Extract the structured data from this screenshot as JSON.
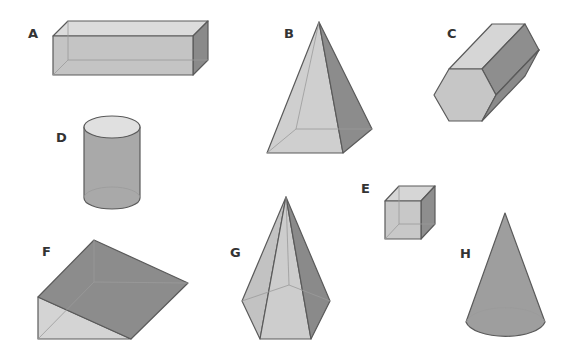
{
  "figure": {
    "background": "#ffffff",
    "shapes": [
      {
        "id": "A",
        "label": "A",
        "name": "rectangular prism"
      },
      {
        "id": "B",
        "label": "B",
        "name": "square pyramid"
      },
      {
        "id": "C",
        "label": "C",
        "name": "hexagonal prism"
      },
      {
        "id": "D",
        "label": "D",
        "name": "cylinder"
      },
      {
        "id": "E",
        "label": "E",
        "name": "cube"
      },
      {
        "id": "F",
        "label": "F",
        "name": "triangular prism"
      },
      {
        "id": "G",
        "label": "G",
        "name": "pentagonal pyramid"
      },
      {
        "id": "H",
        "label": "H",
        "name": "cone"
      }
    ],
    "colors": {
      "light_face": "#d9d9d9",
      "mid_face": "#bdbdbd",
      "dark_face": "#8f8f8f",
      "edge": "#5a5a5a",
      "label": "#333333"
    }
  }
}
